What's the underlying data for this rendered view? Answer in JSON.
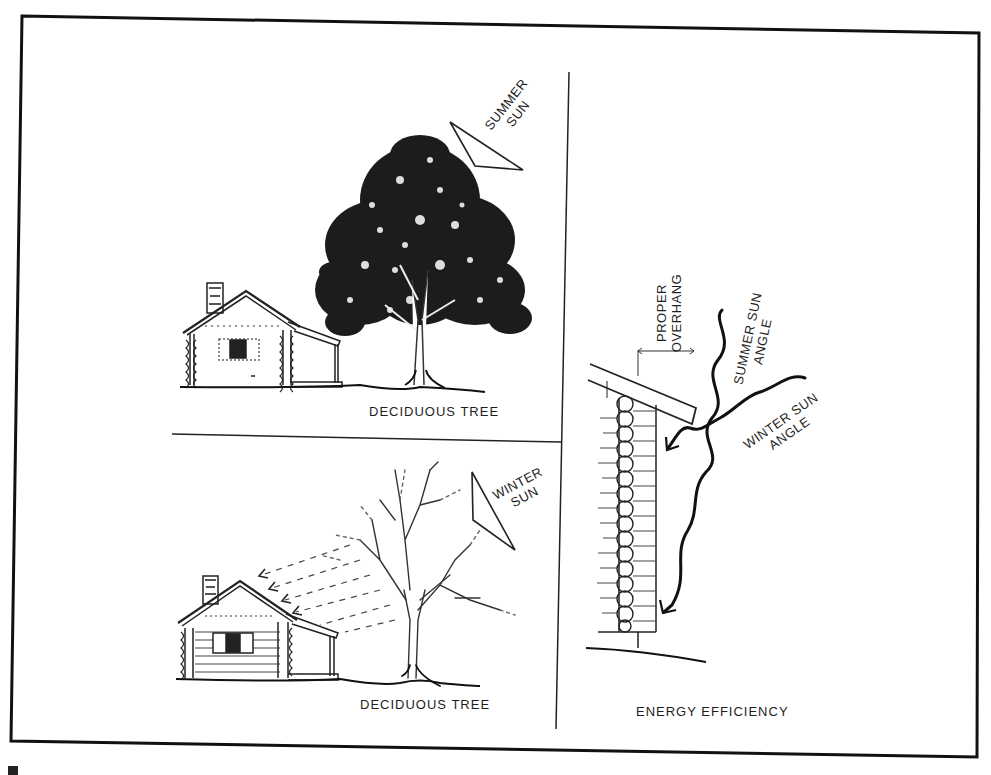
{
  "figure": {
    "caption_visible_fragment": "Fig. 5-5"
  },
  "panels": {
    "summer": {
      "tree_label": "DECIDUOUS TREE",
      "sun_label_line1": "SUMMER",
      "sun_label_line2": "SUN"
    },
    "winter": {
      "tree_label": "DECIDUOUS TREE",
      "sun_label_line1": "WINTER",
      "sun_label_line2": "SUN"
    },
    "efficiency": {
      "title": "ENERGY EFFICIENCY",
      "overhang_line1": "PROPER",
      "overhang_line2": "OVERHANG",
      "summer_angle_line1": "SUMMER SUN",
      "summer_angle_line2": "ANGLE",
      "winter_angle_line1": "WINTER SUN",
      "winter_angle_line2": "ANGLE"
    }
  },
  "colors": {
    "ink": "#1a1a1a",
    "paper": "#ffffff"
  }
}
